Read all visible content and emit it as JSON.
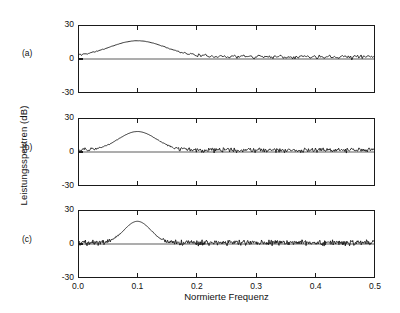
{
  "figure": {
    "panel_labels": [
      "(a)",
      "(b)",
      "(c)"
    ],
    "xlabel": "Normierte Frequenz",
    "ylabel": "Leistungsspektren (dB)",
    "xticklabels": [
      "0.0",
      "0.1",
      "0.2",
      "0.3",
      "0.4",
      "0.5"
    ],
    "yticklabels": [
      "30",
      "0",
      "-30"
    ],
    "line_color": "#141414",
    "frame_color": "#1a1a1a",
    "background": "#ffffff"
  },
  "chart_data": [
    {
      "type": "line",
      "title": "(a)",
      "xlabel": "Normierte Frequenz",
      "ylabel": "Leistungsspektren (dB)",
      "xlim": [
        0.0,
        0.5
      ],
      "ylim": [
        -30,
        30
      ],
      "xticks": [
        0.0,
        0.1,
        0.2,
        0.3,
        0.4,
        0.5
      ],
      "yticks": [
        -30,
        0,
        30
      ],
      "grid": false,
      "legend": "none",
      "annotations": [
        "spectral peak at normalized frequency 0.1, about 16 dB"
      ],
      "series": [
        {
          "name": "power spectrum estimate (a)",
          "peak_frequency": 0.1,
          "peak_value_db": 16,
          "noise_floor_db": -1,
          "noise_std_db": 4.5,
          "null_depth_db": -22,
          "n_points": 256,
          "seed": 11
        }
      ]
    },
    {
      "type": "line",
      "title": "(b)",
      "xlabel": "Normierte Frequenz",
      "ylabel": "Leistungsspektren (dB)",
      "xlim": [
        0.0,
        0.5
      ],
      "ylim": [
        -30,
        30
      ],
      "xticks": [
        0.0,
        0.1,
        0.2,
        0.3,
        0.4,
        0.5
      ],
      "yticks": [
        -30,
        0,
        30
      ],
      "grid": false,
      "legend": "none",
      "annotations": [
        "spectral peak at normalized frequency 0.1, about 18 dB"
      ],
      "series": [
        {
          "name": "power spectrum estimate (b)",
          "peak_frequency": 0.1,
          "peak_value_db": 18,
          "noise_floor_db": -1.5,
          "noise_std_db": 5.5,
          "null_depth_db": -27,
          "n_points": 384,
          "seed": 29
        }
      ]
    },
    {
      "type": "line",
      "title": "(c)",
      "xlabel": "Normierte Frequenz",
      "ylabel": "Leistungsspektren (dB)",
      "xlim": [
        0.0,
        0.5
      ],
      "ylim": [
        -30,
        30
      ],
      "xticks": [
        0.0,
        0.1,
        0.2,
        0.3,
        0.4,
        0.5
      ],
      "yticks": [
        -30,
        0,
        30
      ],
      "grid": false,
      "legend": "none",
      "annotations": [
        "sharp spectral peak at normalized frequency 0.1, about 20 dB"
      ],
      "series": [
        {
          "name": "power spectrum estimate (c)",
          "peak_frequency": 0.1,
          "peak_value_db": 20,
          "noise_floor_db": -2,
          "noise_std_db": 6.5,
          "null_depth_db": -30,
          "n_points": 560,
          "seed": 47
        }
      ]
    }
  ]
}
